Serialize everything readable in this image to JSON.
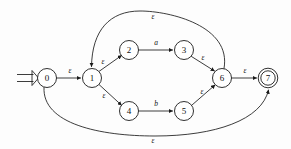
{
  "figure": {
    "kind": "nfa-state-diagram",
    "width": 291,
    "height": 149,
    "background_color": "#fdfdfd",
    "stroke_color": "#1a1a1a",
    "node_fill_color": "#ffffff",
    "epsilon_symbol": "ε"
  },
  "states": [
    {
      "id": "0",
      "label": "0",
      "cx": 47,
      "cy": 78,
      "r": 9.5,
      "accepting": false,
      "start": true
    },
    {
      "id": "1",
      "label": "1",
      "cx": 92,
      "cy": 78,
      "r": 9.5,
      "accepting": false,
      "start": false
    },
    {
      "id": "2",
      "label": "2",
      "cx": 129,
      "cy": 50,
      "r": 9.5,
      "accepting": false,
      "start": false
    },
    {
      "id": "3",
      "label": "3",
      "cx": 184,
      "cy": 50,
      "r": 9.5,
      "accepting": false,
      "start": false
    },
    {
      "id": "4",
      "label": "4",
      "cx": 129,
      "cy": 111,
      "r": 9.5,
      "accepting": false,
      "start": false
    },
    {
      "id": "5",
      "label": "5",
      "cx": 184,
      "cy": 111,
      "r": 9.5,
      "accepting": false,
      "start": false
    },
    {
      "id": "6",
      "label": "6",
      "cx": 222,
      "cy": 78,
      "r": 9.5,
      "accepting": false,
      "start": false
    },
    {
      "id": "7",
      "label": "7",
      "cx": 268,
      "cy": 78,
      "r": 9.5,
      "accepting": true,
      "start": false
    }
  ],
  "transitions": [
    {
      "from": "0",
      "to": "1",
      "symbol": "ε",
      "label_x": 70,
      "label_y": 70,
      "shape": "straight"
    },
    {
      "from": "1",
      "to": "2",
      "symbol": "ε",
      "label_x": 103,
      "label_y": 61,
      "shape": "straight"
    },
    {
      "from": "2",
      "to": "3",
      "symbol": "a",
      "label_x": 156,
      "label_y": 42,
      "shape": "straight"
    },
    {
      "from": "3",
      "to": "6",
      "symbol": "ε",
      "label_x": 203,
      "label_y": 57,
      "shape": "straight"
    },
    {
      "from": "1",
      "to": "4",
      "symbol": "ε",
      "label_x": 104,
      "label_y": 95,
      "shape": "straight"
    },
    {
      "from": "4",
      "to": "5",
      "symbol": "b",
      "label_x": 156,
      "label_y": 103,
      "shape": "straight"
    },
    {
      "from": "5",
      "to": "6",
      "symbol": "ε",
      "label_x": 202,
      "label_y": 91,
      "shape": "straight"
    },
    {
      "from": "6",
      "to": "7",
      "symbol": "ε",
      "label_x": 245,
      "label_y": 70,
      "shape": "straight"
    },
    {
      "from": "6",
      "to": "1",
      "symbol": "ε",
      "label_x": 153,
      "label_y": 16,
      "shape": "arc-top"
    },
    {
      "from": "0",
      "to": "7",
      "symbol": "ε",
      "label_x": 153,
      "label_y": 140,
      "shape": "arc-bottom"
    }
  ],
  "start_marker": {
    "name": "start-double-arrow",
    "x1": 17,
    "x2": 37,
    "y": 78
  }
}
